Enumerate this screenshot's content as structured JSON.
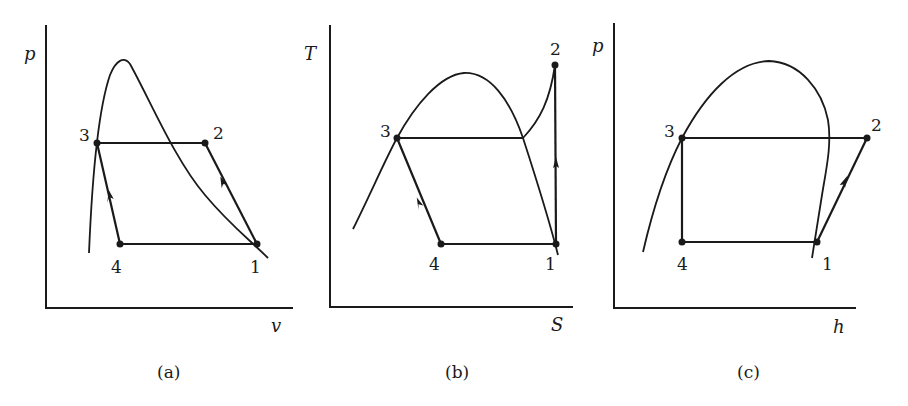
{
  "figure": {
    "panels": [
      {
        "id": "a",
        "caption": "(a)",
        "x_axis_label": "v",
        "y_axis_label": "p",
        "points": [
          {
            "label": "1"
          },
          {
            "label": "2"
          },
          {
            "label": "3"
          },
          {
            "label": "4"
          }
        ]
      },
      {
        "id": "b",
        "caption": "(b)",
        "x_axis_label": "S",
        "y_axis_label": "T",
        "points": [
          {
            "label": "1"
          },
          {
            "label": "2"
          },
          {
            "label": "3"
          },
          {
            "label": "4"
          }
        ]
      },
      {
        "id": "c",
        "caption": "(c)",
        "x_axis_label": "h",
        "y_axis_label": "p",
        "points": [
          {
            "label": "1"
          },
          {
            "label": "2"
          },
          {
            "label": "3"
          },
          {
            "label": "4"
          }
        ]
      }
    ]
  }
}
